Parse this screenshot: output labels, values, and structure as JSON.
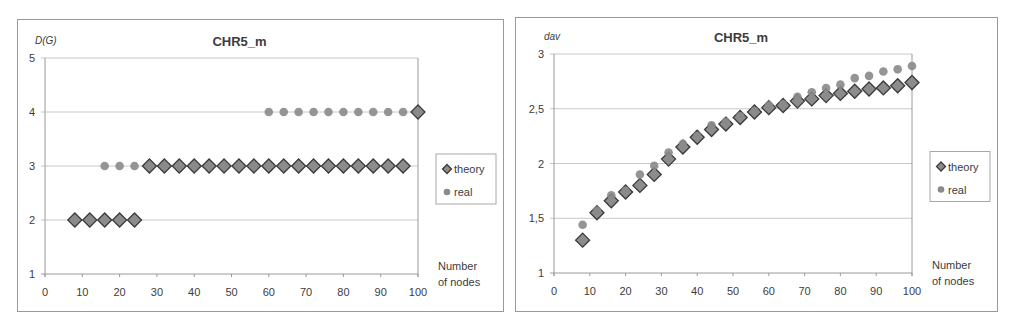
{
  "chart_data": [
    {
      "type": "scatter",
      "title": "CHR5_m",
      "ylabel": "D(G)",
      "xlabel": "Number of nodes",
      "xlabel_lines": [
        "Number",
        "of nodes"
      ],
      "xlim": [
        0,
        100
      ],
      "ylim": [
        1,
        5
      ],
      "x_ticks": [
        "0",
        "10",
        "20",
        "30",
        "40",
        "50",
        "60",
        "70",
        "80",
        "90",
        "100"
      ],
      "y_ticks": [
        "1",
        "2",
        "3",
        "4",
        "5"
      ],
      "grid": "horizontal",
      "legend_position": "right",
      "x": [
        8,
        12,
        16,
        20,
        24,
        28,
        32,
        36,
        40,
        44,
        48,
        52,
        56,
        60,
        64,
        68,
        72,
        76,
        80,
        84,
        88,
        92,
        96,
        100
      ],
      "series": [
        {
          "name": "theory",
          "marker": "diamond",
          "values": [
            2,
            2,
            2,
            2,
            2,
            3,
            3,
            3,
            3,
            3,
            3,
            3,
            3,
            3,
            3,
            3,
            3,
            3,
            3,
            3,
            3,
            3,
            3,
            4
          ]
        },
        {
          "name": "real",
          "marker": "circle",
          "values": [
            2,
            2,
            3,
            3,
            3,
            3,
            3,
            3,
            3,
            3,
            3,
            3,
            3,
            4,
            4,
            4,
            4,
            4,
            4,
            4,
            4,
            4,
            4,
            4
          ]
        }
      ]
    },
    {
      "type": "scatter",
      "title": "CHR5_m",
      "ylabel": "dav",
      "xlabel": "Number of nodes",
      "xlabel_lines": [
        "Number",
        "of nodes"
      ],
      "xlim": [
        0,
        100
      ],
      "ylim": [
        1,
        3
      ],
      "x_ticks": [
        "0",
        "10",
        "20",
        "30",
        "40",
        "50",
        "60",
        "70",
        "80",
        "90",
        "100"
      ],
      "y_ticks": [
        "1",
        "1,5",
        "2",
        "2,5",
        "3"
      ],
      "grid": "horizontal",
      "legend_position": "right",
      "x": [
        8,
        12,
        16,
        20,
        24,
        28,
        32,
        36,
        40,
        44,
        48,
        52,
        56,
        60,
        64,
        68,
        72,
        76,
        80,
        84,
        88,
        92,
        96,
        100
      ],
      "series": [
        {
          "name": "theory",
          "marker": "diamond",
          "values": [
            1.3,
            1.55,
            1.66,
            1.74,
            1.8,
            1.9,
            2.04,
            2.15,
            2.24,
            2.31,
            2.36,
            2.42,
            2.47,
            2.51,
            2.53,
            2.57,
            2.59,
            2.62,
            2.64,
            2.66,
            2.68,
            2.69,
            2.71,
            2.74
          ]
        },
        {
          "name": "real",
          "marker": "circle",
          "values": [
            1.44,
            1.57,
            1.71,
            1.75,
            1.9,
            1.98,
            2.1,
            2.18,
            2.25,
            2.35,
            2.38,
            2.43,
            2.48,
            2.53,
            2.54,
            2.61,
            2.65,
            2.69,
            2.72,
            2.78,
            2.8,
            2.84,
            2.86,
            2.89
          ]
        }
      ]
    }
  ],
  "colors": {
    "theory_fill": "#8c8c8c",
    "theory_stroke": "#3a3a3a",
    "real_fill": "#8a8a8a",
    "grid": "#c8c8c8",
    "axis": "#9a9a9a",
    "text": "#3c3c3c"
  },
  "layout": [
    {
      "frame": {
        "left": 17,
        "top": 19,
        "width": 487,
        "height": 293
      },
      "plot": {
        "x0": 27,
        "x1": 400,
        "y_top": 38,
        "y_bottom": 254
      }
    },
    {
      "frame": {
        "left": 515,
        "top": 17,
        "width": 483,
        "height": 295
      },
      "plot": {
        "x0": 38,
        "x1": 396,
        "y_top": 36,
        "y_bottom": 255
      }
    }
  ]
}
